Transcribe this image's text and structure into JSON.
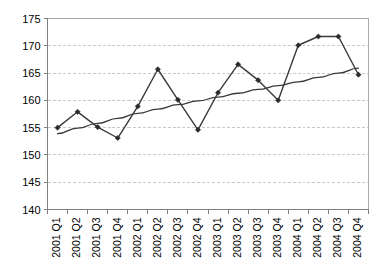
{
  "chart_data": {
    "type": "line",
    "title": "",
    "subtitle": "",
    "xlabel": "",
    "ylabel": "",
    "ylim": [
      140,
      175
    ],
    "yticks": [
      140,
      145,
      150,
      155,
      160,
      165,
      170,
      175
    ],
    "ytick_labels": [
      "140",
      "145",
      "150",
      "155",
      "160",
      "165",
      "170",
      "175"
    ],
    "grid": true,
    "grid_axis": "y",
    "grid_style": "dashed",
    "legend": false,
    "legend_position": "none",
    "categories": [
      "2001 Q1",
      "2001 Q2",
      "2001 Q3",
      "2001 Q4",
      "2002 Q1",
      "2002 Q2",
      "2002 Q3",
      "2002 Q4",
      "2003 Q1",
      "2003 Q2",
      "2003 Q3",
      "2003 Q4",
      "2004 Q1",
      "2004 Q2",
      "2004 Q3",
      "2004 Q4"
    ],
    "xtick_rotation": 90,
    "series": [
      {
        "name": "series-1",
        "type": "line-markers",
        "marker": "diamond",
        "color": "#2b2b2b",
        "values": [
          155.0,
          157.9,
          155.1,
          153.1,
          158.9,
          165.7,
          160.1,
          154.6,
          161.4,
          166.6,
          163.7,
          160.0,
          170.1,
          171.7,
          171.7,
          164.7
        ]
      },
      {
        "name": "trendline",
        "type": "trend",
        "marker": "none",
        "color": "#3a3a3a",
        "values": [
          153.9,
          154.9,
          155.8,
          156.7,
          157.6,
          158.4,
          159.2,
          159.9,
          160.6,
          161.3,
          162.0,
          162.7,
          163.4,
          164.2,
          165.0,
          165.9
        ]
      }
    ]
  }
}
